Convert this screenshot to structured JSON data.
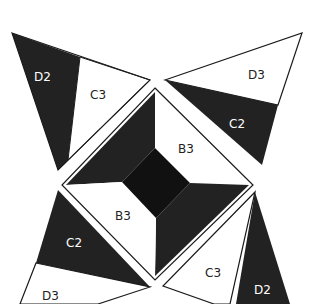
{
  "diagram": {
    "colors": {
      "dark": "#222222",
      "darker": "#111111",
      "light": "#ffffff",
      "stroke": "#1a1a1a"
    },
    "pieces": {
      "tl_dark": "D2",
      "tl_light": "C3",
      "tr_light": "D3",
      "tr_dark": "C2",
      "center_top_right": "B3",
      "center_bottom_left": "B3",
      "bl_dark": "C2",
      "bl_light": "D3",
      "br_light": "C3",
      "br_dark": "D2"
    }
  }
}
